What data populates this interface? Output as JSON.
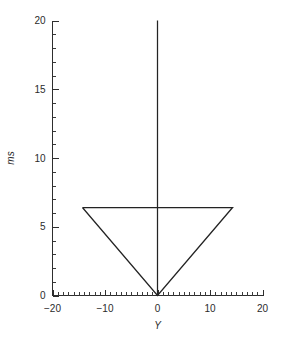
{
  "chart_data": {
    "type": "line",
    "title": "",
    "subtitle": "",
    "xlabel": "Y",
    "ylabel": "ms",
    "xlim": [
      -20,
      20
    ],
    "ylim": [
      0,
      20
    ],
    "grid": false,
    "legend": null,
    "x_ticks": [
      -20,
      -10,
      0,
      10,
      20
    ],
    "x_tick_labels": [
      "−20",
      "−10",
      "0",
      "10",
      "20"
    ],
    "x_minor_step": 1,
    "y_ticks": [
      0,
      5,
      10,
      15,
      20
    ],
    "y_tick_labels": [
      "0",
      "5",
      "10",
      "15",
      "20"
    ],
    "y_minor_step": 1,
    "series": [
      {
        "name": "vertical-stem",
        "points": [
          [
            0,
            0
          ],
          [
            0,
            20
          ]
        ]
      },
      {
        "name": "triangle-outline",
        "points": [
          [
            -14.3,
            6.4
          ],
          [
            14.3,
            6.4
          ],
          [
            0,
            0
          ],
          [
            -14.3,
            6.4
          ]
        ]
      }
    ],
    "annotations": []
  },
  "axes": {
    "x_axis_name": "x-axis",
    "y_axis_name": "y-axis"
  }
}
